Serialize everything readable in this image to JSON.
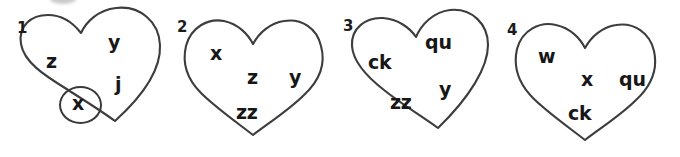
{
  "worksheet": {
    "shape": "heart",
    "stroke_color": "#3d3d3d",
    "text_color": "#171717",
    "items": [
      {
        "index": "1",
        "sounds": [
          "z",
          "y",
          "j",
          "x"
        ],
        "circled_sound": "x"
      },
      {
        "index": "2",
        "sounds": [
          "x",
          "z",
          "y",
          "zz"
        ],
        "circled_sound": ""
      },
      {
        "index": "3",
        "sounds": [
          "ck",
          "qu",
          "y",
          "zz"
        ],
        "circled_sound": ""
      },
      {
        "index": "4",
        "sounds": [
          "w",
          "x",
          "qu",
          "ck"
        ],
        "circled_sound": ""
      }
    ]
  }
}
